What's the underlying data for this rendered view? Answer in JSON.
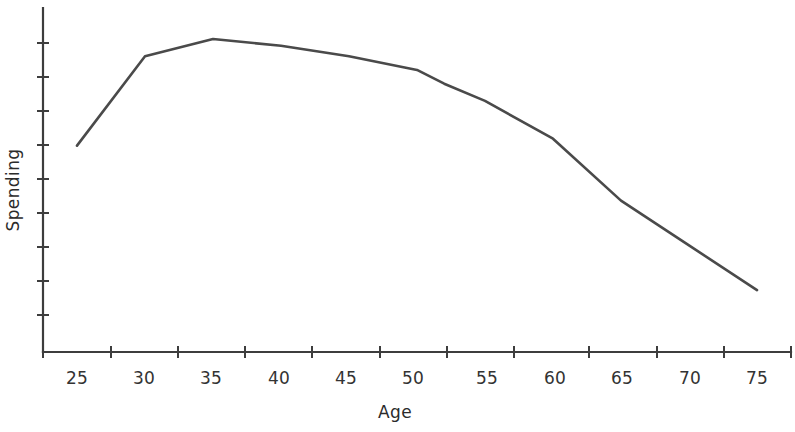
{
  "chart_data": {
    "type": "line",
    "title": "",
    "xlabel": "Age",
    "ylabel": "Spending",
    "x": [
      25,
      30,
      35,
      40,
      45,
      50,
      52,
      55,
      60,
      65,
      70,
      75
    ],
    "values": [
      60,
      86,
      91,
      89,
      86,
      82,
      78,
      73,
      62,
      44,
      31,
      18
    ],
    "series": [
      {
        "name": "Spending",
        "x": [
          25,
          30,
          35,
          40,
          45,
          50,
          52,
          55,
          60,
          65,
          70,
          75
        ],
        "values": [
          60,
          86,
          91,
          89,
          86,
          82,
          78,
          73,
          62,
          44,
          31,
          18
        ]
      }
    ],
    "xtick_labels": [
      "25",
      "30",
      "35",
      "40",
      "45",
      "50",
      "55",
      "60",
      "65",
      "70",
      "75"
    ],
    "xtick_values": [
      25,
      30,
      35,
      40,
      45,
      50,
      55,
      60,
      65,
      70,
      75
    ],
    "ytick_labels": [],
    "ytick_count": 9,
    "xlim": [
      22.5,
      77.5
    ],
    "ylim": [
      0,
      100
    ],
    "grid": false,
    "legend": false,
    "legend_position": "none",
    "line_color": "#4a4a4a",
    "axis_color": "#3d3d3d",
    "background_color": "#ffffff",
    "annotations": []
  },
  "axes": {
    "x_title": "Age",
    "y_title": "Spending"
  }
}
